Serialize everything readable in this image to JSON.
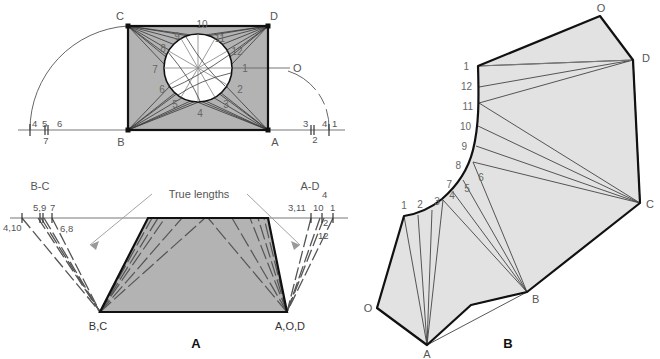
{
  "figure": {
    "colors": {
      "fill_gray": "#b3b3b3",
      "fill_light": "#e2e2e2",
      "outline_dark": "#1a1a1a",
      "thin_line": "#4d4d4d",
      "label_gray": "#555555",
      "background": "#ffffff"
    }
  },
  "top_view": {
    "corner_labels": {
      "C": "C",
      "D": "D",
      "B": "B",
      "A": "A",
      "O": "O"
    },
    "circle_points": [
      "1",
      "2",
      "3",
      "4",
      "5",
      "6",
      "7",
      "8",
      "9",
      "10",
      "11",
      "12"
    ],
    "baseline_left_labels": {
      "above_1": "4",
      "above_2": "5",
      "above_3": "6",
      "below": "7"
    },
    "baseline_right_labels": {
      "above_1": "3",
      "above_2": "4",
      "above_3": "1",
      "below": "2"
    }
  },
  "true_length_diagram": {
    "caption": "A",
    "annotation": "True lengths",
    "left_group": {
      "header": "B-C",
      "on_line_1": "5,9",
      "on_line_2": "7",
      "far_left": "4,10",
      "right_of_line": "6,8",
      "apex": "B,C"
    },
    "right_group": {
      "header": "A-D",
      "header_sub": "4",
      "on_line_1": "3,11",
      "on_line_2": "10",
      "on_line_3": "1",
      "below_1": "2",
      "below_2": "12",
      "apex": "A,O,D"
    }
  },
  "development": {
    "caption": "B",
    "corner_labels": {
      "O_top": "O",
      "D": "D",
      "C": "C",
      "B": "B",
      "A": "A",
      "O_bottom": "O"
    },
    "upper_curve_points": [
      "1",
      "12",
      "11",
      "10",
      "9",
      "8",
      "7"
    ],
    "lower_curve_points": [
      "1",
      "2",
      "3",
      "4",
      "5",
      "6"
    ]
  }
}
